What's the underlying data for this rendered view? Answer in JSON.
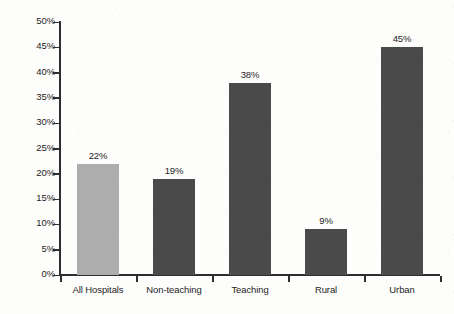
{
  "chart_data": {
    "type": "bar",
    "title": "",
    "subtitle": "",
    "xlabel": "",
    "ylabel": "",
    "categories": [
      "All Hospitals",
      "Non-teaching",
      "Teaching",
      "Rural",
      "Urban"
    ],
    "values": [
      22,
      19,
      38,
      9,
      45
    ],
    "value_labels": [
      "22%",
      "19%",
      "38%",
      "9%",
      "45%"
    ],
    "bar_colors": [
      "#ADADAD",
      "#4A4A4A",
      "#4A4A4A",
      "#4A4A4A",
      "#4A4A4A"
    ],
    "ylim": [
      0,
      50
    ],
    "ytick_step": 5,
    "ytick_labels": [
      "50%",
      "45%",
      "40%",
      "35%",
      "30%",
      "25%",
      "20%",
      "15%",
      "10%",
      "5%",
      "0%"
    ],
    "ytick_values": [
      50,
      45,
      40,
      35,
      30,
      25,
      20,
      15,
      10,
      5,
      0
    ],
    "grid": false,
    "legend": null,
    "legend_position": "none",
    "annotations": [],
    "axis_color": "#2E2E2E",
    "background_color": "#FDFDFB",
    "value_label_position": "above-bar"
  }
}
